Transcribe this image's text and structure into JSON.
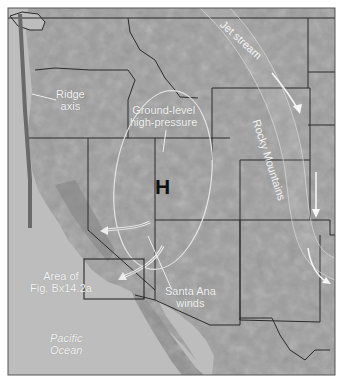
{
  "map": {
    "title": "Western United States — Santa Ana wind setup",
    "colors": {
      "ocean": "#bdbdbd",
      "land": "#9c9c9c",
      "land_dark": "#7a7a7a",
      "border": "#2a2a2a",
      "annotation": "#f2f2f2",
      "ridge_axis": "#6a6a6a"
    },
    "labels": {
      "ridge_axis": [
        "Ridge",
        "axis"
      ],
      "high_pressure": [
        "Ground-level",
        "high-pressure"
      ],
      "high_symbol": "H",
      "jet_stream": "Jet stream",
      "rocky_mountains": "Rocky Mountains",
      "area_of_fig": [
        "Area of",
        "Fig. Bx14.2a"
      ],
      "santa_ana": [
        "Santa Ana",
        "winds"
      ],
      "ocean": [
        "Pacific",
        "Ocean"
      ]
    }
  }
}
